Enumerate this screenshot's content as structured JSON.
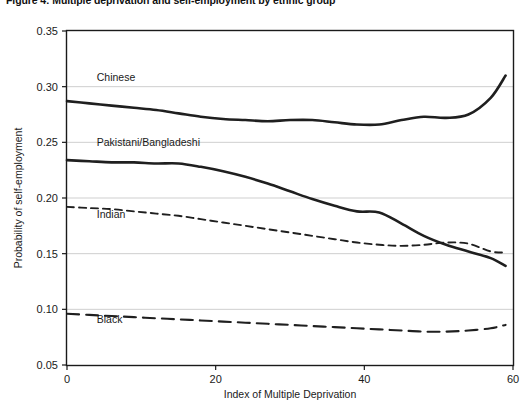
{
  "title": "Figure 4: Multiple deprivation and self-employment by ethnic group",
  "axis": {
    "x_label": "Index of Multiple Deprivation",
    "y_label": "Probability of self-employment",
    "x_ticks": [
      "0",
      "20",
      "40",
      "60"
    ],
    "y_ticks": [
      "0.35",
      "0.30",
      "0.25",
      "0.20",
      "0.15",
      "0.10",
      "0.05"
    ]
  },
  "series_labels": {
    "chinese": "Chinese",
    "pakistani_bangladeshi": "Pakistani/Bangladeshi",
    "indian": "Indian",
    "black": "Black"
  },
  "chart_data": {
    "type": "line",
    "title": "Figure 4: Multiple deprivation and self-employment by ethnic group",
    "xlabel": "Index of Multiple Deprivation",
    "ylabel": "Probability of self-employment",
    "xlim": [
      0,
      60
    ],
    "ylim": [
      0.05,
      0.35
    ],
    "xticks": [
      0,
      20,
      40,
      60
    ],
    "yticks": [
      0.05,
      0.1,
      0.15,
      0.2,
      0.25,
      0.3,
      0.35
    ],
    "grid": "horizontal",
    "legend": "inline-labels",
    "x": [
      0,
      3,
      6,
      9,
      12,
      15,
      18,
      21,
      24,
      27,
      30,
      33,
      36,
      39,
      42,
      45,
      48,
      51,
      54,
      57,
      59
    ],
    "series": [
      {
        "name": "Chinese",
        "style": "solid",
        "color": "#1f1f1f",
        "label_position": {
          "x": 4,
          "y": 0.305
        },
        "values": [
          0.287,
          0.285,
          0.283,
          0.281,
          0.279,
          0.276,
          0.273,
          0.271,
          0.27,
          0.269,
          0.27,
          0.27,
          0.268,
          0.266,
          0.266,
          0.27,
          0.273,
          0.272,
          0.275,
          0.29,
          0.31
        ]
      },
      {
        "name": "Pakistani/Bangladeshi",
        "style": "solid",
        "color": "#1f1f1f",
        "label_position": {
          "x": 4,
          "y": 0.247
        },
        "values": [
          0.234,
          0.233,
          0.232,
          0.232,
          0.231,
          0.231,
          0.228,
          0.224,
          0.219,
          0.213,
          0.206,
          0.199,
          0.193,
          0.188,
          0.187,
          0.177,
          0.166,
          0.158,
          0.152,
          0.146,
          0.139
        ]
      },
      {
        "name": "Indian",
        "style": "dashed",
        "color": "#1f1f1f",
        "label_position": {
          "x": 4,
          "y": 0.182
        },
        "values": [
          0.192,
          0.191,
          0.19,
          0.188,
          0.186,
          0.184,
          0.181,
          0.178,
          0.175,
          0.172,
          0.169,
          0.166,
          0.163,
          0.16,
          0.158,
          0.157,
          0.158,
          0.16,
          0.159,
          0.152,
          0.151
        ]
      },
      {
        "name": "Black",
        "style": "long-dashed",
        "color": "#1f1f1f",
        "label_position": {
          "x": 4,
          "y": 0.088
        },
        "values": [
          0.096,
          0.095,
          0.094,
          0.093,
          0.092,
          0.091,
          0.09,
          0.089,
          0.088,
          0.087,
          0.086,
          0.085,
          0.084,
          0.083,
          0.082,
          0.081,
          0.08,
          0.08,
          0.081,
          0.083,
          0.086
        ]
      }
    ]
  }
}
